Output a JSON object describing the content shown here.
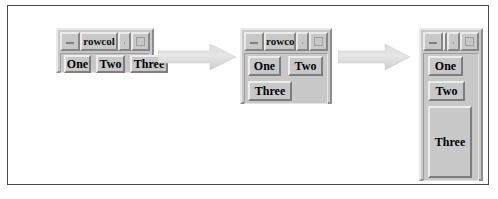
{
  "figure": {
    "background": "#ffffff",
    "border_color": "#4a4a4a"
  },
  "palette": {
    "window_face": "#c8c8c8",
    "shadow": "#858585",
    "highlight": "#eaeaea",
    "arrow_fill": "#e0e0e0",
    "text": "#000000"
  },
  "windows": [
    {
      "id": "window-wide",
      "title": "rowcol",
      "title_full": "rowcol",
      "titlebar": {
        "minimize": "minimize-button",
        "restore": "restore-button",
        "maximize": "maximize-button"
      },
      "layout": "single-row",
      "buttons": [
        {
          "label": "One"
        },
        {
          "label": "Two"
        },
        {
          "label": "Three"
        }
      ]
    },
    {
      "id": "window-medium",
      "title": "rowco",
      "title_full": "rowcol",
      "titlebar": {
        "minimize": "minimize-button",
        "restore": "restore-button",
        "maximize": "maximize-button"
      },
      "layout": "two-rows",
      "buttons": [
        {
          "label": "One"
        },
        {
          "label": "Two"
        },
        {
          "label": "Three"
        }
      ]
    },
    {
      "id": "window-narrow",
      "title": "row",
      "title_full": "rowcol",
      "titlebar": {
        "minimize": "minimize-button",
        "restore": "restore-button",
        "maximize": "maximize-button"
      },
      "layout": "single-column",
      "buttons": [
        {
          "label": "One"
        },
        {
          "label": "Two"
        },
        {
          "label": "Three"
        }
      ]
    }
  ],
  "arrows": [
    {
      "id": "arrow-1",
      "direction": "right"
    },
    {
      "id": "arrow-2",
      "direction": "right"
    }
  ]
}
